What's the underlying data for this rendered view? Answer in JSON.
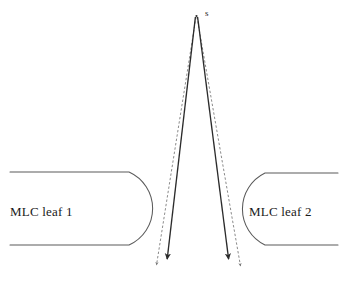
{
  "figure": {
    "background_color": "#ffffff",
    "width": 339,
    "height": 289
  },
  "source": {
    "label": "s",
    "description": "radiation source point",
    "x": 196,
    "y": 15
  },
  "leaves": [
    {
      "label": "MLC leaf 1",
      "side": "left",
      "top_y": 172,
      "bottom_y": 245,
      "outer_x": 10,
      "tip_x": 168
    },
    {
      "label": "MLC leaf 2",
      "side": "right",
      "top_y": 173,
      "bottom_y": 245,
      "outer_x": 338,
      "tip_x": 226
    }
  ],
  "rays": [
    {
      "name": "left-solid-ray",
      "style": "solid",
      "color": "#2b2b2b",
      "from_x": 195,
      "from_y": 17,
      "to_x": 167,
      "to_y": 264,
      "arrowhead": true
    },
    {
      "name": "left-dashed-ray",
      "style": "dashed",
      "color": "#6f6f6f",
      "from_x": 196,
      "from_y": 17,
      "to_x": 156,
      "to_y": 270,
      "arrowhead": true
    },
    {
      "name": "right-solid-ray",
      "style": "solid",
      "color": "#2b2b2b",
      "from_x": 198,
      "from_y": 17,
      "to_x": 228,
      "to_y": 264,
      "arrowhead": true
    },
    {
      "name": "right-dashed-ray",
      "style": "dashed",
      "color": "#6f6f6f",
      "from_x": 197,
      "from_y": 17,
      "to_x": 241,
      "to_y": 271,
      "arrowhead": true
    }
  ],
  "colors": {
    "leaf_outline": "#5a5a5a",
    "solid_ray": "#2b2b2b",
    "dashed_ray": "#777777",
    "text": "#1a1a1a",
    "background": "#ffffff"
  }
}
